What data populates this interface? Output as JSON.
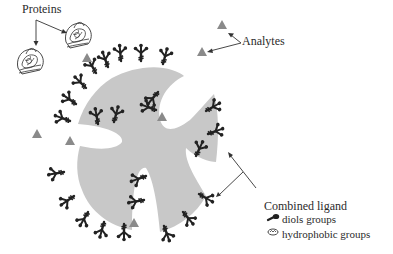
{
  "labels": {
    "proteins": "Proteins",
    "analytes": "Analytes",
    "combined_ligand": "Combined ligand",
    "diols_groups": "diols groups",
    "hydrophobic_groups": "hydrophobic groups"
  },
  "colors": {
    "bead": "#c8c8c8",
    "ligand": "#222222",
    "analyte": "#8a8a8a",
    "arrow": "#333333",
    "text": "#2b2b2b"
  },
  "elements": {
    "bead": "porous-bead-particle",
    "ligand_icon": "combined-ligand-icon",
    "analyte_icon": "triangle-analyte-icon",
    "protein_icon": "protein-ribbon-icon"
  }
}
